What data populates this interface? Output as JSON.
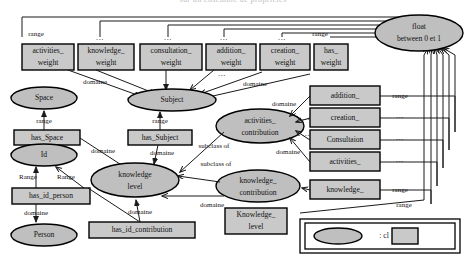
{
  "figure": {
    "type": "ontology-class-diagram",
    "cut_off_caption_top": "sur un ensemble de propriétés",
    "notation": {
      "ellipse_meaning": ": cl",
      "legend_label": ": cl"
    }
  },
  "edge_labels": {
    "range": "range",
    "Range": "Range",
    "domaine": "domaine",
    "subclass_of": "subclass of",
    "ellipsis": "..."
  },
  "nodes": {
    "weight_boxes": [
      {
        "id": "activities_weight",
        "line1": "activities_",
        "line2": "weight",
        "top_label": "range"
      },
      {
        "id": "knowledge_weight",
        "line1": "knowledge_",
        "line2": "weight",
        "top_label": "..."
      },
      {
        "id": "consultation_weight",
        "line1": "consultation_",
        "line2": "weight",
        "top_label": "..."
      },
      {
        "id": "addition_weight",
        "line1": "addition_",
        "line2": "weight",
        "top_label": "..."
      },
      {
        "id": "creation_weight",
        "line1": "creation_",
        "line2": "weight",
        "top_label": "..."
      },
      {
        "id": "has_weight",
        "line1": "has_",
        "line2": "weight",
        "top_label": "range"
      }
    ],
    "right_boxes": [
      {
        "id": "addition_",
        "label": "addition_",
        "right_label": "range"
      },
      {
        "id": "creation_",
        "label": "creation_",
        "right_label": "..."
      },
      {
        "id": "Consultaion",
        "label": "Consultaion",
        "right_label": "..."
      },
      {
        "id": "activities_",
        "label": "activities_",
        "right_label": "..."
      },
      {
        "id": "knowledge_",
        "label": "knowledge_",
        "right_label": "range"
      }
    ],
    "left_boxes": [
      {
        "id": "has_Space",
        "label": "has_Space"
      },
      {
        "id": "has_Subject",
        "label": "has_Subject"
      },
      {
        "id": "has_id_person",
        "label": "has_id_person"
      },
      {
        "id": "has_id_contribution",
        "label": "has_id_contribution"
      },
      {
        "id": "Knowledge_level_box",
        "line1": "Knowledge_",
        "line2": "level"
      }
    ],
    "ellipses": [
      {
        "id": "float",
        "line1": "float",
        "line2": "between 0 et 1"
      },
      {
        "id": "Space",
        "line1": "Space",
        "line2": ""
      },
      {
        "id": "Subject",
        "line1": "Subject",
        "line2": ""
      },
      {
        "id": "Id",
        "line1": "Id",
        "line2": ""
      },
      {
        "id": "Person",
        "line1": "Person",
        "line2": ""
      },
      {
        "id": "knowledge_level",
        "line1": "knowledge",
        "line2": "level"
      },
      {
        "id": "activities_contribution",
        "line1": "activities_",
        "line2": "contribution"
      },
      {
        "id": "knowledge_contribution",
        "line1": "knowledge_",
        "line2": "contribution"
      }
    ]
  },
  "relations": [
    {
      "from": "activities_weight",
      "to": "float",
      "label": "range"
    },
    {
      "from": "knowledge_weight",
      "to": "float",
      "label": "..."
    },
    {
      "from": "consultation_weight",
      "to": "float",
      "label": "..."
    },
    {
      "from": "addition_weight",
      "to": "float",
      "label": "..."
    },
    {
      "from": "creation_weight",
      "to": "float",
      "label": "..."
    },
    {
      "from": "has_weight",
      "to": "float",
      "label": "range"
    },
    {
      "from": "activities_weight",
      "to": "Subject",
      "label": "domaine"
    },
    {
      "from": "knowledge_weight",
      "to": "Subject",
      "label": "domaine"
    },
    {
      "from": "consultation_weight",
      "to": "Subject",
      "label": "domaine"
    },
    {
      "from": "addition_weight",
      "to": "Subject",
      "label": "domaine"
    },
    {
      "from": "creation_weight",
      "to": "Subject",
      "label": "domaine"
    },
    {
      "from": "has_weight",
      "to": "activities_contribution",
      "label": "domaine"
    },
    {
      "from": "has_Space",
      "to": "Space",
      "label": "range"
    },
    {
      "from": "has_Space",
      "to": "knowledge_level",
      "label": "domaine"
    },
    {
      "from": "has_Subject",
      "to": "Subject",
      "label": "range"
    },
    {
      "from": "has_Subject",
      "to": "knowledge_level",
      "label": "domaine"
    },
    {
      "from": "has_id_person",
      "to": "Id",
      "label": "Range"
    },
    {
      "from": "has_id_person",
      "to": "Person",
      "label": "domaine"
    },
    {
      "from": "has_id_contribution",
      "to": "Id",
      "label": "Range"
    },
    {
      "from": "has_id_contribution",
      "to": "knowledge_level",
      "label": "domaine"
    },
    {
      "from": "activities_contribution",
      "to": "knowledge_level",
      "label": "subclass of"
    },
    {
      "from": "knowledge_contribution",
      "to": "knowledge_level",
      "label": "subclass of"
    },
    {
      "from": "addition_",
      "to": "activities_contribution",
      "label": "domaine"
    },
    {
      "from": "creation_",
      "to": "activities_contribution",
      "label": "domaine"
    },
    {
      "from": "Consultaion",
      "to": "activities_contribution",
      "label": "domaine"
    },
    {
      "from": "activities_",
      "to": "activities_contribution",
      "label": "domaine"
    },
    {
      "from": "knowledge_",
      "to": "knowledge_contribution",
      "label": "domaine"
    },
    {
      "from": "addition_",
      "to": "float",
      "label": "range"
    },
    {
      "from": "creation_",
      "to": "float",
      "label": "..."
    },
    {
      "from": "Consultaion",
      "to": "float",
      "label": "..."
    },
    {
      "from": "activities_",
      "to": "float",
      "label": "..."
    },
    {
      "from": "knowledge_",
      "to": "float",
      "label": "range"
    },
    {
      "from": "Knowledge_level_box",
      "to": "float",
      "label": "range"
    }
  ],
  "colors": {
    "node_fill_box": "#c9c9c9",
    "node_fill_ellipse": "#bfbfbf",
    "stroke": "#000000",
    "background": "#ffffff"
  }
}
